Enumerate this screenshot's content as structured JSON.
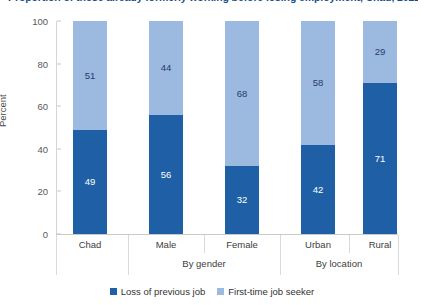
{
  "chart_data": {
    "type": "bar",
    "subtype": "stacked-percent",
    "title": "Proportion of those already formerly working before losing employment, Chad, 2022",
    "xlabel": "",
    "ylabel": "Percent",
    "ylim": [
      0,
      100
    ],
    "yticks": [
      0,
      20,
      40,
      60,
      80,
      100
    ],
    "grid": false,
    "legend_position": "bottom",
    "categories": [
      "Chad",
      "Male",
      "Female",
      "Urban",
      "Rural"
    ],
    "group_labels": [
      "",
      "By gender",
      "By location"
    ],
    "groups": [
      {
        "label": "",
        "categories": [
          "Chad"
        ]
      },
      {
        "label": "By gender",
        "categories": [
          "Male",
          "Female"
        ]
      },
      {
        "label": "By location",
        "categories": [
          "Urban",
          "Rural"
        ]
      }
    ],
    "series": [
      {
        "name": "Loss of previous job",
        "color": "#1f5fa6",
        "values": [
          49,
          56,
          32,
          42,
          71
        ]
      },
      {
        "name": "First-time job seeker",
        "color": "#9cb9e0",
        "values": [
          51,
          44,
          68,
          58,
          29
        ]
      }
    ]
  },
  "axis": {
    "y_label": "Percent",
    "y_ticks": [
      "0",
      "20",
      "40",
      "60",
      "80",
      "100"
    ]
  },
  "bars": [
    {
      "category": "Chad",
      "bottom_value": "49",
      "top_value": "51"
    },
    {
      "category": "Male",
      "bottom_value": "56",
      "top_value": "44"
    },
    {
      "category": "Female",
      "bottom_value": "32",
      "top_value": "68"
    },
    {
      "category": "Urban",
      "bottom_value": "42",
      "top_value": "58"
    },
    {
      "category": "Rural",
      "bottom_value": "71",
      "top_value": "29"
    }
  ],
  "groups": [
    {
      "label": "By gender"
    },
    {
      "label": "By location"
    }
  ],
  "legend": {
    "items": [
      {
        "label": "Loss of previous job",
        "color": "#1f5fa6"
      },
      {
        "label": "First-time job seeker",
        "color": "#9cb9e0"
      }
    ]
  },
  "colors": {
    "series_bottom": "#1f5fa6",
    "series_top": "#9cb9e0",
    "axis": "#c9c9c9",
    "text": "#3d3d3d"
  }
}
